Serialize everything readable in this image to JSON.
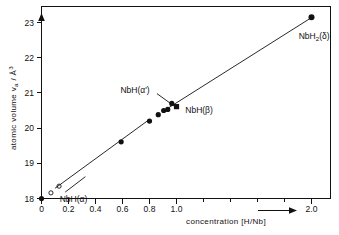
{
  "chart_data": {
    "type": "scatter",
    "title": "",
    "xlabel": "concentration [H/Nb]",
    "ylabel": "atomic volume v_a / Å³",
    "ylabel_main": "atomic volume v",
    "ylabel_sub": "a",
    "ylabel_unit": " / Å",
    "ylabel_unit_sup": "3",
    "xlim": [
      0,
      2.14
    ],
    "ylim": [
      17.55,
      23.45
    ],
    "grid": false,
    "legend": "none",
    "xticks": [
      0,
      0.2,
      0.4,
      0.6,
      0.8,
      1.0,
      2.0
    ],
    "xticklabels": [
      "0",
      "0.2",
      "0.4",
      "0.6",
      "0.8",
      "1.0",
      "2.0"
    ],
    "xminorticks": [
      1.2,
      1.4,
      1.6,
      1.8
    ],
    "yticks": [
      18,
      19,
      20,
      21,
      22,
      23
    ],
    "yticklabels": [
      "18",
      "19",
      "20",
      "21",
      "22",
      "23"
    ],
    "series": [
      {
        "name": "NbH(alpha) open",
        "marker": "open-circle",
        "points": [
          {
            "x": 0.07,
            "y": 18.16
          },
          {
            "x": 0.13,
            "y": 18.35
          }
        ]
      },
      {
        "name": "filled circles",
        "marker": "filled-circle",
        "points": [
          {
            "x": 0.0,
            "y": 18.0
          },
          {
            "x": 0.59,
            "y": 19.61
          },
          {
            "x": 0.8,
            "y": 20.2
          },
          {
            "x": 0.865,
            "y": 20.38
          },
          {
            "x": 0.905,
            "y": 20.5
          },
          {
            "x": 0.935,
            "y": 20.53
          },
          {
            "x": 0.965,
            "y": 20.7
          },
          {
            "x": 2.0,
            "y": 23.15
          }
        ]
      },
      {
        "name": "NbH(beta)",
        "marker": "filled-square",
        "points": [
          {
            "x": 1.0,
            "y": 20.61
          }
        ]
      }
    ],
    "lines": [
      {
        "name": "lower-fit",
        "x1": 0.1,
        "y1": 18.29,
        "x2": 0.79,
        "y2": 20.22
      },
      {
        "name": "upper-fit",
        "x1": 0.93,
        "y1": 20.55,
        "x2": 2.0,
        "y2": 23.14
      }
    ],
    "annotations": [
      {
        "name": "NbH-alpha",
        "text": "NbH(α)",
        "x": 0.135,
        "y": 18.0,
        "leader": {
          "x1": 0.175,
          "y1": 18.18,
          "x2": 0.325,
          "y2": 18.62
        }
      },
      {
        "name": "NbH-alpha-prime",
        "text": "NbH(α')",
        "x": 0.585,
        "y": 21.08,
        "leader": {
          "x1": 0.855,
          "y1": 20.98,
          "x2": 0.985,
          "y2": 20.62
        }
      },
      {
        "name": "NbH-beta",
        "text": "NbH(β)",
        "x": 1.065,
        "y": 20.52
      },
      {
        "name": "NbH2-delta",
        "text": "NbH₂(δ)",
        "x": 1.905,
        "y": 22.62,
        "text_main": "NbH",
        "text_sub": "2",
        "text_tail": "(δ)"
      }
    ],
    "axis_arrows": {
      "y_arrow": true,
      "x_arrow": true
    }
  }
}
